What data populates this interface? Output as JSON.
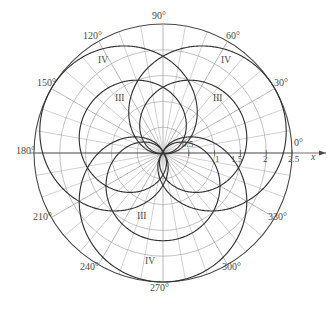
{
  "figure": {
    "type": "polar-plot",
    "background_color": "#ffffff",
    "stroke_color": "#4a4a4a",
    "grid_color": "#999999",
    "curve_color": "#333333"
  },
  "axis": {
    "x_axis_label": "x",
    "x_axis_arrow": "arrow-right-icon"
  },
  "angle_labels": [
    {
      "text": "0°",
      "deg": 0
    },
    {
      "text": "30°",
      "deg": 30
    },
    {
      "text": "60°",
      "deg": 60
    },
    {
      "text": "90°",
      "deg": 90
    },
    {
      "text": "120°",
      "deg": 120
    },
    {
      "text": "150°",
      "deg": 150
    },
    {
      "text": "180°",
      "deg": 180
    },
    {
      "text": "210°",
      "deg": 210
    },
    {
      "text": "240°",
      "deg": 240
    },
    {
      "text": "270°",
      "deg": 270
    },
    {
      "text": "300°",
      "deg": 300
    },
    {
      "text": "330°",
      "deg": 330
    }
  ],
  "radial_ticks": [
    {
      "text": "0.5",
      "value": 0.5
    },
    {
      "text": "1",
      "value": 1.0
    },
    {
      "text": "1.5",
      "value": 1.5
    },
    {
      "text": "2",
      "value": 2.0
    },
    {
      "text": "2.5",
      "value": 2.5
    }
  ],
  "curve_labels": [
    {
      "text": "IV",
      "position": "upper-left"
    },
    {
      "text": "IV",
      "position": "upper-right"
    },
    {
      "text": "III",
      "position": "mid-left"
    },
    {
      "text": "III",
      "position": "mid-right"
    },
    {
      "text": "III",
      "position": "lower-center"
    },
    {
      "text": "IV",
      "position": "bottom-center"
    }
  ],
  "chart_data": {
    "type": "line",
    "coordinate_system": "polar",
    "title": "",
    "xlabel": "x",
    "ylabel": "",
    "grid": true,
    "legend": "none",
    "rlim": [
      0,
      2.5
    ],
    "r_ticks": [
      0.5,
      1,
      1.5,
      2,
      2.5
    ],
    "theta_ticks_deg": [
      0,
      30,
      60,
      90,
      120,
      150,
      180,
      210,
      240,
      270,
      300,
      330
    ],
    "theta_minor_step_deg": 10,
    "series": [
      {
        "name": "III",
        "label": "III",
        "family": "limacon",
        "formula": "r = a + b*cos(theta - phi)",
        "instances": [
          {
            "a": 0.85,
            "b": 0.85,
            "phi_deg": 150,
            "label_at_deg": 150
          },
          {
            "a": 0.85,
            "b": 0.85,
            "phi_deg": 30,
            "label_at_deg": 30
          },
          {
            "a": 0.85,
            "b": 0.85,
            "phi_deg": 270,
            "label_at_deg": 270
          }
        ]
      },
      {
        "name": "IV",
        "label": "IV",
        "family": "limacon",
        "formula": "r = a + b*cos(theta - phi)",
        "instances": [
          {
            "a": 1.25,
            "b": 1.25,
            "phi_deg": 150,
            "label_at_deg": 150
          },
          {
            "a": 1.25,
            "b": 1.25,
            "phi_deg": 30,
            "label_at_deg": 30
          },
          {
            "a": 1.25,
            "b": 1.25,
            "phi_deg": 270,
            "label_at_deg": 270
          }
        ]
      }
    ],
    "boundary_circle_r": 2.5
  }
}
